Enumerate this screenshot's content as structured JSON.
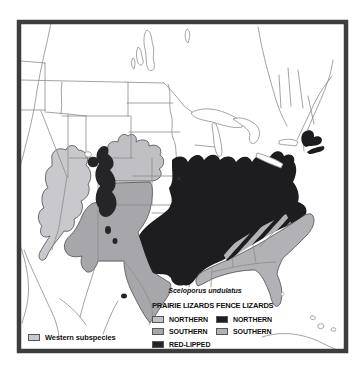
{
  "figure": {
    "species_title": "Sceloporus undulatus",
    "western_note": "Western subspecies",
    "legend_groups": [
      {
        "title": "PRAIRIE LIZARDS",
        "items": [
          {
            "label": "NORTHERN",
            "color": "#c0c0c4"
          },
          {
            "label": "SOUTHERN",
            "color": "#a7a7ab"
          },
          {
            "label": "RED-LIPPED",
            "color": "#252528"
          }
        ]
      },
      {
        "title": "FENCE LIZARDS",
        "items": [
          {
            "label": "NORTHERN",
            "color": "#1d1d1f"
          },
          {
            "label": "SOUTHERN",
            "color": "#b2b2b6"
          }
        ]
      }
    ],
    "colors": {
      "western_subspecies": "#c9c9cd",
      "map_frame": "#3d3d3d",
      "boundary_lines": "#8b8b8b",
      "background": "#ffffff"
    },
    "map_x_marker": "×"
  }
}
